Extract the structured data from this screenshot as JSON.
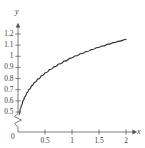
{
  "chart_data": {
    "type": "line",
    "title": "",
    "subtitle": "",
    "xlabel": "x",
    "ylabel": "y",
    "xlim": [
      0,
      2.1
    ],
    "ylim": [
      0.45,
      1.25
    ],
    "grid": false,
    "legend": null,
    "axis_break": {
      "axis": "y",
      "symbol": "zigzag",
      "note": "y-axis broken between 0 and 0.5"
    },
    "origin_label": "0",
    "x_ticks": [
      {
        "value": 0.5,
        "label": "0.5"
      },
      {
        "value": 1.0,
        "label": "1"
      },
      {
        "value": 1.5,
        "label": "1.5"
      },
      {
        "value": 2.0,
        "label": "2"
      }
    ],
    "y_ticks": [
      {
        "value": 1.2,
        "label": "1.2"
      },
      {
        "value": 1.1,
        "label": "1.1"
      },
      {
        "value": 1.0,
        "label": "1"
      },
      {
        "value": 0.9,
        "label": "0.9"
      },
      {
        "value": 0.8,
        "label": "0.8"
      },
      {
        "value": 0.7,
        "label": "0.7"
      },
      {
        "value": 0.6,
        "label": "0.6"
      },
      {
        "value": 0.5,
        "label": "0.5"
      }
    ],
    "series": [
      {
        "name": "curve",
        "color": "#2b2b2b",
        "x": [
          0.02,
          0.04,
          0.06,
          0.09,
          0.12,
          0.16,
          0.2,
          0.25,
          0.3,
          0.36,
          0.43,
          0.5,
          0.58,
          0.66,
          0.75,
          0.85,
          0.95,
          1.05,
          1.15,
          1.25,
          1.35,
          1.45,
          1.55,
          1.65,
          1.75,
          1.85,
          1.95,
          2.0
        ],
        "y": [
          0.475,
          0.525,
          0.56,
          0.6,
          0.635,
          0.672,
          0.703,
          0.737,
          0.765,
          0.795,
          0.825,
          0.852,
          0.88,
          0.905,
          0.931,
          0.957,
          0.981,
          1.003,
          1.023,
          1.042,
          1.06,
          1.077,
          1.092,
          1.107,
          1.121,
          1.134,
          1.147,
          1.153
        ]
      }
    ],
    "colors": {
      "curve": "#2b2b2b",
      "axis": "#6e6e6e",
      "text": "#3b3b3b",
      "background": "#ffffff"
    }
  },
  "geometry": {
    "width": 145,
    "height": 148,
    "axis_x": 18,
    "axis_y_top": 22,
    "axis_y_bottom": 132,
    "x_axis_y": 132,
    "x_axis_right": 141,
    "y_value_top": 1.2,
    "y_pixel_top": 34,
    "y_value_bottom": 0.5,
    "y_pixel_bottom": 112,
    "x_value_right": 2,
    "x_pixel_right": 126,
    "break_top": 114,
    "break_bottom": 127
  }
}
